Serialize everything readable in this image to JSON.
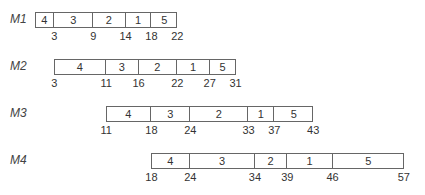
{
  "diagram": {
    "type": "gantt",
    "rows": [
      {
        "machine": "M1",
        "start": 0,
        "jobs": [
          {
            "job": "4",
            "start": 0,
            "end": 3
          },
          {
            "job": "3",
            "start": 3,
            "end": 9
          },
          {
            "job": "2",
            "start": 9,
            "end": 14
          },
          {
            "job": "1",
            "start": 14,
            "end": 18
          },
          {
            "job": "5",
            "start": 18,
            "end": 22
          }
        ],
        "ticks": [
          "3",
          "9",
          "14",
          "18",
          "22"
        ]
      },
      {
        "machine": "M2",
        "start": 3,
        "jobs": [
          {
            "job": "4",
            "start": 3,
            "end": 11
          },
          {
            "job": "3",
            "start": 11,
            "end": 16
          },
          {
            "job": "2",
            "start": 16,
            "end": 22
          },
          {
            "job": "1",
            "start": 22,
            "end": 27
          },
          {
            "job": "5",
            "start": 27,
            "end": 31
          }
        ],
        "ticks": [
          "3",
          "11",
          "16",
          "22",
          "27",
          "31"
        ]
      },
      {
        "machine": "M3",
        "start": 11,
        "jobs": [
          {
            "job": "4",
            "start": 11,
            "end": 18
          },
          {
            "job": "3",
            "start": 18,
            "end": 24
          },
          {
            "job": "2",
            "start": 24,
            "end": 33
          },
          {
            "job": "1",
            "start": 33,
            "end": 37
          },
          {
            "job": "5",
            "start": 37,
            "end": 43
          }
        ],
        "ticks": [
          "11",
          "18",
          "24",
          "33",
          "37",
          "43"
        ]
      },
      {
        "machine": "M4",
        "start": 18,
        "jobs": [
          {
            "job": "4",
            "start": 18,
            "end": 24
          },
          {
            "job": "3",
            "start": 24,
            "end": 34
          },
          {
            "job": "2",
            "start": 34,
            "end": 39
          },
          {
            "job": "1",
            "start": 39,
            "end": 46
          },
          {
            "job": "5",
            "start": 46,
            "end": 57
          }
        ],
        "ticks": [
          "18",
          "24",
          "34",
          "39",
          "46",
          "57"
        ]
      }
    ]
  }
}
